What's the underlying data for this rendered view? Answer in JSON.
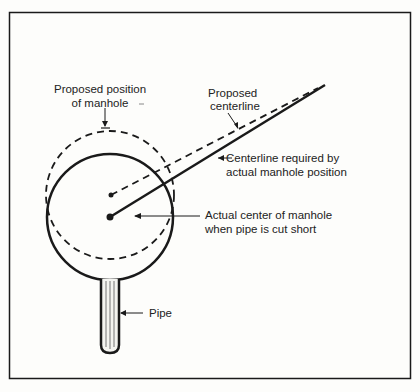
{
  "diagram": {
    "labels": {
      "proposed_position_l1": "Proposed position",
      "proposed_position_l2": "of manhole",
      "proposed_centerline_l1": "Proposed",
      "proposed_centerline_l2": "centerline",
      "required_centerline_l1": "Centerline required by",
      "required_centerline_l2": "actual manhole position",
      "actual_center_l1": "Actual center of manhole",
      "actual_center_l2": "when pipe is cut short",
      "pipe": "Pipe"
    },
    "colors": {
      "ink": "#1a1a1a",
      "background": "#fdfdfb"
    }
  }
}
